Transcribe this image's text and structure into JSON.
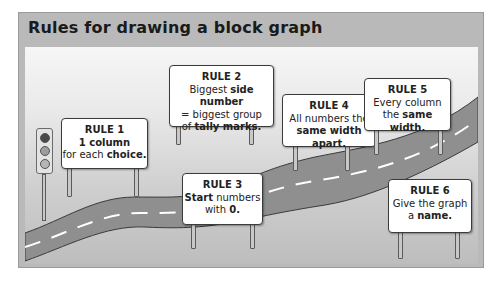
{
  "title": "Rules for drawing a block graph",
  "colors": {
    "panel_border": "#b9b9b9",
    "road": "#8f8f8f",
    "road_marking": "#ffffff",
    "sign_fill": "#ffffff",
    "sign_border": "#3b3b3b"
  },
  "signs": [
    {
      "rule": "RULE 1",
      "lines": [
        {
          "bold": "1 column"
        },
        {
          "pre": "for each ",
          "bold": "choice."
        }
      ]
    },
    {
      "rule": "RULE 2",
      "lines": [
        {
          "pre": "Biggest ",
          "bold": "side number"
        },
        {
          "pre": "= biggest group"
        },
        {
          "pre": "of ",
          "bold": "tally marks."
        }
      ]
    },
    {
      "rule": "RULE 3",
      "lines": [
        {
          "bold": "Start",
          "post": " numbers"
        },
        {
          "pre": "with ",
          "bold": "0."
        }
      ]
    },
    {
      "rule": "RULE 4",
      "lines": [
        {
          "pre": "All numbers the"
        },
        {
          "bold": "same width apart."
        }
      ]
    },
    {
      "rule": "RULE 5",
      "lines": [
        {
          "pre": "Every column"
        },
        {
          "pre": "the ",
          "bold": "same width."
        }
      ]
    },
    {
      "rule": "RULE 6",
      "lines": [
        {
          "pre": "Give the graph"
        },
        {
          "pre": "a ",
          "bold": "name."
        }
      ]
    }
  ],
  "decor": {
    "traffic_light": "traffic-light-icon",
    "road": "winding-road"
  }
}
